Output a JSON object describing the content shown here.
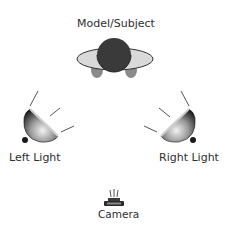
{
  "diagram": {
    "nodes": [
      {
        "id": "subject",
        "label": "Model/Subject",
        "icon": "person-top-view-icon"
      },
      {
        "id": "left_light",
        "label": "Left Light",
        "icon": "spotlight-icon"
      },
      {
        "id": "right_light",
        "label": "Right Light",
        "icon": "spotlight-icon"
      },
      {
        "id": "camera",
        "label": "Camera",
        "icon": "camera-icon"
      }
    ],
    "colors": {
      "head": "#3a3a3a",
      "shoulders": "#d9d9d9",
      "arms": "#8a8a8a",
      "light_rays": "#555555",
      "text": "#2e2e2e"
    }
  }
}
